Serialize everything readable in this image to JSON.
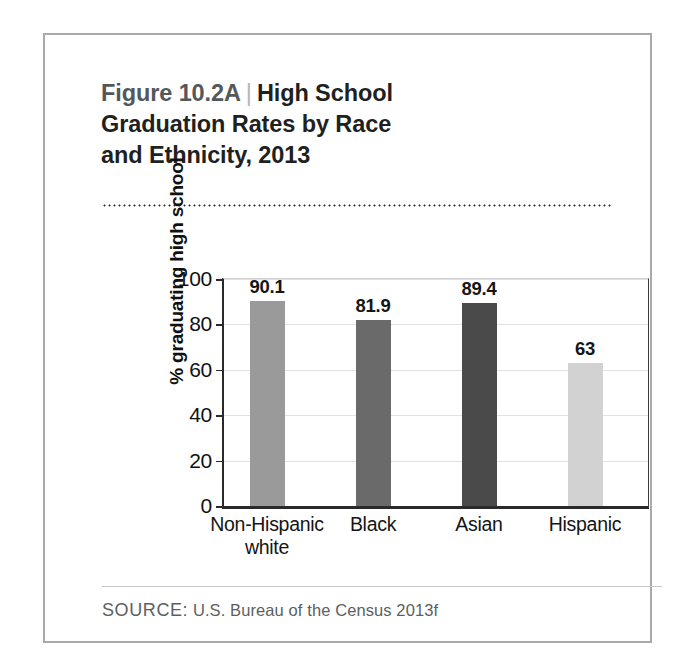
{
  "figure": {
    "number_label": "Figure 10.2A",
    "separator": "|",
    "title": "High School Graduation Rates by Race and Ethnicity, 2013",
    "title_line1": "High School",
    "title_line2": "Graduation Rates by Race",
    "title_line3": "and Ethnicity, 2013",
    "source_label": "SOURCE:",
    "source_text": "U.S. Bureau of the Census 2013f",
    "border_color": "#a9a9a9"
  },
  "chart_data": {
    "type": "bar",
    "categories": [
      "Non-Hispanic white",
      "Black",
      "Asian",
      "Hispanic"
    ],
    "category_lines": [
      [
        "Non-Hispanic",
        "white"
      ],
      [
        "Black"
      ],
      [
        "Asian"
      ],
      [
        "Hispanic"
      ]
    ],
    "values": [
      90.1,
      81.9,
      89.4,
      63
    ],
    "value_labels": [
      "90.1",
      "81.9",
      "89.4",
      "63"
    ],
    "bar_colors": [
      "#9a9a9a",
      "#6a6a6a",
      "#4a4a4a",
      "#d2d2d2"
    ],
    "xlabel": "",
    "ylabel": "% graduating high school",
    "ylim": [
      0,
      100
    ],
    "yticks": [
      0,
      20,
      40,
      60,
      80,
      100
    ],
    "ytick_labels": [
      "0",
      "20",
      "40",
      "60",
      "80",
      "100"
    ],
    "grid": true,
    "legend": false,
    "source": "SOURCE: U.S. Bureau of the Census 2013f"
  }
}
